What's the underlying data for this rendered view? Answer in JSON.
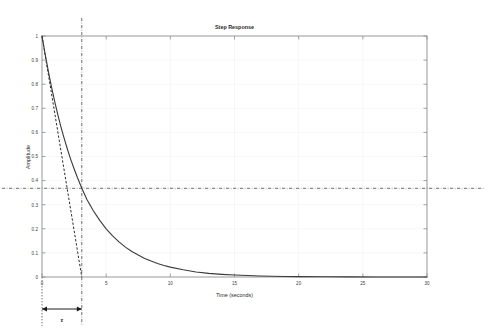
{
  "chart_data": {
    "type": "line",
    "title": "Step Response",
    "xlabel": "Time (seconds)",
    "ylabel": "Amplitude",
    "xlim": [
      0,
      30
    ],
    "ylim": [
      0,
      1
    ],
    "grid": true,
    "legend": "none",
    "xticks": [
      "0",
      "5",
      "10",
      "15",
      "20",
      "25",
      "30"
    ],
    "xtick_values": [
      0,
      5,
      10,
      15,
      20,
      25,
      30
    ],
    "yticks": [
      "0",
      "0.1",
      "0.2",
      "0.3",
      "0.4",
      "0.5",
      "0.6",
      "0.7",
      "0.8",
      "0.9",
      "1"
    ],
    "ytick_values": [
      0,
      0.1,
      0.2,
      0.3,
      0.4,
      0.5,
      0.6,
      0.7,
      0.8,
      0.9,
      1
    ],
    "series": [
      {
        "name": "exponential-decay",
        "style": "solid",
        "equation": "y = exp(-t/tau)",
        "tau": 3.1,
        "x": [
          0,
          0.25,
          0.5,
          0.75,
          1,
          1.25,
          1.5,
          1.75,
          2,
          2.25,
          2.5,
          2.75,
          3,
          3.1,
          3.5,
          4,
          4.5,
          5,
          5.5,
          6,
          6.5,
          7,
          7.5,
          8,
          8.5,
          9,
          9.5,
          10,
          11,
          12,
          13,
          14,
          15,
          16,
          17,
          18,
          19,
          20,
          22,
          24,
          26,
          28,
          30
        ],
        "y": [
          1,
          0.923,
          0.852,
          0.786,
          0.726,
          0.67,
          0.618,
          0.571,
          0.527,
          0.486,
          0.449,
          0.414,
          0.382,
          0.368,
          0.322,
          0.275,
          0.235,
          0.2,
          0.171,
          0.146,
          0.124,
          0.106,
          0.091,
          0.077,
          0.066,
          0.056,
          0.048,
          0.041,
          0.03,
          0.021,
          0.015,
          0.011,
          0.008,
          0.006,
          0.004,
          0.003,
          0.002,
          0.0015,
          0.0008,
          0.0004,
          0.0002,
          0.0001,
          0.0001
        ]
      },
      {
        "name": "initial-tangent",
        "style": "dashed",
        "equation": "y = 1 - t/tau",
        "x": [
          0,
          3.1
        ],
        "y": [
          1,
          0
        ]
      }
    ],
    "annotations": [
      {
        "name": "tau-horizontal-reference",
        "type": "hline",
        "style": "dash-dot",
        "value": 0.368,
        "label": "1/e"
      },
      {
        "name": "tau-vertical-reference",
        "type": "vline",
        "style": "dash-dot",
        "value": 3.1,
        "label": "tau"
      },
      {
        "name": "origin-vertical-reference",
        "type": "vline",
        "style": "dotted",
        "value": 0,
        "label": ""
      },
      {
        "name": "tau-span-arrow",
        "type": "double-arrow",
        "from": 0,
        "to": 3.1,
        "label": "τ"
      }
    ]
  },
  "figure": {
    "title": "Step Response",
    "tau_symbol": "τ",
    "xlabel": "Time (seconds)",
    "ylabel": "Amplitude",
    "colors": {
      "curve": "#3a3a3a",
      "tangent": "#2a2a2a",
      "reference": "#3a3a3a",
      "axis": "#8a8a8a",
      "grid": "#f0f0f0",
      "background": "#ffffff",
      "text": "#2b2b2b"
    }
  }
}
